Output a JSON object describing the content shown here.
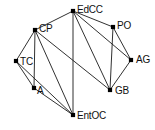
{
  "diagram": {
    "background_color": "#ffffff",
    "edge_color": "#1a1a1a",
    "node_color": "#000000",
    "label_color": "#111111",
    "width": 155,
    "height": 130
  },
  "chart_data": {
    "type": "diagram",
    "layout": "node-link graph",
    "directed": false,
    "title": "",
    "nodes": [
      {
        "id": "EdCC",
        "label": "EdCC",
        "x": 73,
        "y": 11,
        "label_dx": 4,
        "label_dy": -6
      },
      {
        "id": "PO",
        "label": "PO",
        "x": 113,
        "y": 27,
        "label_dx": 4,
        "label_dy": -6
      },
      {
        "id": "CP",
        "label": "CP",
        "x": 35,
        "y": 30,
        "label_dx": 4,
        "label_dy": -6
      },
      {
        "id": "AG",
        "label": "AG",
        "x": 131,
        "y": 60,
        "label_dx": 5,
        "label_dy": -5
      },
      {
        "id": "TC",
        "label": "TC",
        "x": 16,
        "y": 61,
        "label_dx": 4,
        "label_dy": -4
      },
      {
        "id": "A",
        "label": "A",
        "x": 34,
        "y": 88,
        "label_dx": 3,
        "label_dy": -2
      },
      {
        "id": "GB",
        "label": "GB",
        "x": 110,
        "y": 90,
        "label_dx": 5,
        "label_dy": -4
      },
      {
        "id": "EntOC",
        "label": "EntOC",
        "x": 73,
        "y": 115,
        "label_dx": 4,
        "label_dy": -4
      }
    ],
    "edges": [
      {
        "source": "EdCC",
        "target": "CP"
      },
      {
        "source": "EdCC",
        "target": "PO"
      },
      {
        "source": "EdCC",
        "target": "AG"
      },
      {
        "source": "EdCC",
        "target": "GB"
      },
      {
        "source": "EdCC",
        "target": "EntOC"
      },
      {
        "source": "PO",
        "target": "AG"
      },
      {
        "source": "PO",
        "target": "GB"
      },
      {
        "source": "AG",
        "target": "GB"
      },
      {
        "source": "CP",
        "target": "TC"
      },
      {
        "source": "CP",
        "target": "A"
      },
      {
        "source": "CP",
        "target": "EntOC"
      },
      {
        "source": "CP",
        "target": "GB"
      },
      {
        "source": "TC",
        "target": "A"
      },
      {
        "source": "TC",
        "target": "EntOC"
      },
      {
        "source": "A",
        "target": "EntOC"
      }
    ],
    "node_count": 8,
    "edge_count": 15
  }
}
